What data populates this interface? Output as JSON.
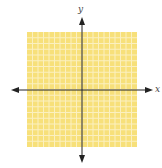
{
  "chart_data": {
    "type": "coordinate-plane",
    "title": "",
    "xlabel": "x",
    "ylabel": "y",
    "grid": true,
    "grid_cells_x": 20,
    "grid_cells_y": 20,
    "xlim": [
      -10,
      10
    ],
    "ylim": [
      -10,
      10
    ],
    "tick_labels": [],
    "series": []
  },
  "colors": {
    "grid_fill": "#f7e07a",
    "grid_line": "#fbf0c0",
    "axis": "#222222"
  },
  "labels": {
    "x_axis": "x",
    "y_axis": "y"
  }
}
